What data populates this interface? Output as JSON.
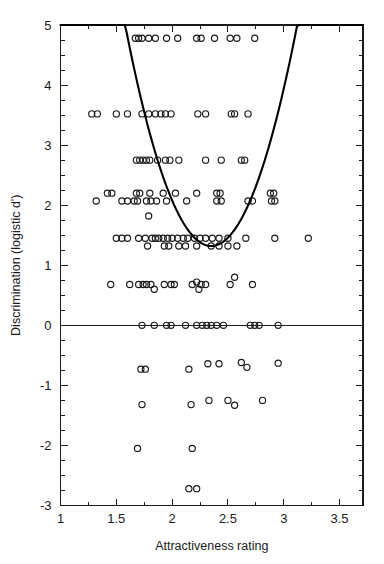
{
  "chart_data": {
    "type": "scatter",
    "title": "",
    "xlabel": "Attractiveness rating",
    "ylabel": "Discrimination (logistic d')",
    "xlim": [
      1,
      3.71
    ],
    "ylim": [
      -3,
      5
    ],
    "grid": false,
    "legend": null,
    "x_ticks": [
      1,
      1.5,
      2,
      2.5,
      3,
      3.5
    ],
    "x_ticklabels": [
      "1",
      "1.5",
      "2",
      "2.5",
      "3",
      "3.5"
    ],
    "x_minor_tick_step": 0.25,
    "y_ticks": [
      -3,
      -2,
      -1,
      0,
      1,
      2,
      3,
      4,
      5
    ],
    "y_ticklabels": [
      "-3",
      "-2",
      "-1",
      "0",
      "1",
      "2",
      "3",
      "4",
      "5"
    ],
    "y_minor_tick_step": 0.25,
    "marker": "open-circle",
    "marker_radius": 3.1,
    "reference_lines": [
      {
        "name": "zero-line",
        "orientation": "horizontal",
        "y": 0
      }
    ],
    "fit_curve": {
      "name": "quadratic-fit",
      "description": "U-shaped fitted curve",
      "vertex_x": 2.35,
      "vertex_y": 1.32,
      "curvature": 6.2,
      "x_start": 1.0,
      "x_end": 3.71,
      "y_at_x_start": 4.5,
      "y_at_x_end": 3.65
    },
    "points": [
      [
        1.67,
        4.78
      ],
      [
        1.7,
        4.78
      ],
      [
        1.73,
        4.78
      ],
      [
        1.79,
        4.78
      ],
      [
        1.85,
        4.78
      ],
      [
        1.95,
        4.78
      ],
      [
        2.05,
        4.78
      ],
      [
        2.22,
        4.78
      ],
      [
        2.26,
        4.78
      ],
      [
        2.38,
        4.78
      ],
      [
        2.52,
        4.78
      ],
      [
        2.58,
        4.78
      ],
      [
        2.74,
        4.78
      ],
      [
        1.28,
        3.52
      ],
      [
        1.33,
        3.52
      ],
      [
        1.5,
        3.52
      ],
      [
        1.6,
        3.52
      ],
      [
        1.73,
        3.52
      ],
      [
        1.79,
        3.52
      ],
      [
        1.85,
        3.52
      ],
      [
        1.9,
        3.52
      ],
      [
        1.94,
        3.52
      ],
      [
        1.99,
        3.52
      ],
      [
        2.23,
        3.52
      ],
      [
        2.3,
        3.52
      ],
      [
        2.53,
        3.52
      ],
      [
        2.56,
        3.52
      ],
      [
        2.68,
        3.52
      ],
      [
        1.68,
        2.75
      ],
      [
        1.71,
        2.75
      ],
      [
        1.74,
        2.75
      ],
      [
        1.77,
        2.75
      ],
      [
        1.8,
        2.75
      ],
      [
        1.87,
        2.75
      ],
      [
        1.94,
        2.75
      ],
      [
        1.98,
        2.75
      ],
      [
        2.06,
        2.75
      ],
      [
        2.3,
        2.75
      ],
      [
        2.44,
        2.75
      ],
      [
        2.62,
        2.75
      ],
      [
        2.65,
        2.75
      ],
      [
        1.42,
        2.2
      ],
      [
        1.46,
        2.2
      ],
      [
        1.68,
        2.2
      ],
      [
        1.71,
        2.2
      ],
      [
        1.8,
        2.2
      ],
      [
        1.92,
        2.2
      ],
      [
        2.03,
        2.2
      ],
      [
        2.22,
        2.2
      ],
      [
        2.4,
        2.2
      ],
      [
        2.43,
        2.2
      ],
      [
        2.88,
        2.2
      ],
      [
        2.91,
        2.2
      ],
      [
        1.32,
        2.07
      ],
      [
        1.55,
        2.07
      ],
      [
        1.6,
        2.07
      ],
      [
        1.66,
        2.07
      ],
      [
        1.69,
        2.07
      ],
      [
        1.77,
        2.07
      ],
      [
        1.81,
        2.07
      ],
      [
        1.86,
        2.07
      ],
      [
        1.95,
        2.07
      ],
      [
        2.13,
        2.07
      ],
      [
        2.4,
        2.07
      ],
      [
        2.44,
        2.07
      ],
      [
        2.68,
        2.07
      ],
      [
        2.72,
        2.07
      ],
      [
        2.89,
        2.07
      ],
      [
        2.92,
        2.07
      ],
      [
        1.5,
        1.45
      ],
      [
        1.55,
        1.45
      ],
      [
        1.6,
        1.45
      ],
      [
        1.7,
        1.45
      ],
      [
        1.76,
        1.45
      ],
      [
        1.79,
        1.82
      ],
      [
        1.82,
        1.45
      ],
      [
        1.85,
        1.45
      ],
      [
        1.88,
        1.45
      ],
      [
        1.92,
        1.45
      ],
      [
        1.96,
        1.45
      ],
      [
        2.0,
        1.45
      ],
      [
        2.05,
        1.45
      ],
      [
        2.1,
        1.45
      ],
      [
        2.14,
        1.45
      ],
      [
        2.2,
        1.45
      ],
      [
        2.25,
        1.45
      ],
      [
        2.3,
        1.45
      ],
      [
        2.36,
        1.45
      ],
      [
        2.42,
        1.45
      ],
      [
        2.5,
        1.45
      ],
      [
        2.66,
        1.45
      ],
      [
        2.92,
        1.45
      ],
      [
        3.22,
        1.45
      ],
      [
        1.78,
        1.32
      ],
      [
        1.93,
        1.32
      ],
      [
        1.97,
        1.32
      ],
      [
        2.06,
        1.32
      ],
      [
        2.12,
        1.32
      ],
      [
        2.22,
        1.32
      ],
      [
        2.35,
        1.32
      ],
      [
        2.42,
        1.32
      ],
      [
        2.5,
        1.32
      ],
      [
        2.58,
        1.32
      ],
      [
        1.45,
        0.68
      ],
      [
        1.62,
        0.68
      ],
      [
        1.7,
        0.68
      ],
      [
        1.74,
        0.68
      ],
      [
        1.77,
        0.68
      ],
      [
        1.81,
        0.68
      ],
      [
        1.93,
        0.68
      ],
      [
        1.99,
        0.68
      ],
      [
        2.02,
        0.68
      ],
      [
        2.18,
        0.68
      ],
      [
        2.22,
        0.72
      ],
      [
        2.26,
        0.68
      ],
      [
        2.3,
        0.68
      ],
      [
        2.52,
        0.68
      ],
      [
        2.56,
        0.8
      ],
      [
        2.72,
        0.68
      ],
      [
        1.84,
        0.6
      ],
      [
        2.24,
        0.6
      ],
      [
        1.73,
        0.0
      ],
      [
        1.84,
        0.0
      ],
      [
        1.95,
        0.0
      ],
      [
        1.99,
        0.0
      ],
      [
        2.12,
        0.0
      ],
      [
        2.22,
        0.0
      ],
      [
        2.27,
        0.0
      ],
      [
        2.31,
        0.0
      ],
      [
        2.35,
        0.0
      ],
      [
        2.4,
        0.0
      ],
      [
        2.46,
        0.0
      ],
      [
        2.7,
        0.0
      ],
      [
        2.74,
        0.0
      ],
      [
        2.78,
        0.0
      ],
      [
        2.95,
        0.0
      ],
      [
        1.72,
        -0.73
      ],
      [
        1.76,
        -0.73
      ],
      [
        2.15,
        -0.73
      ],
      [
        2.32,
        -0.64
      ],
      [
        2.42,
        -0.64
      ],
      [
        2.62,
        -0.62
      ],
      [
        2.67,
        -0.7
      ],
      [
        2.95,
        -0.63
      ],
      [
        1.69,
        -2.05
      ],
      [
        2.18,
        -2.05
      ],
      [
        1.73,
        -1.32
      ],
      [
        2.17,
        -1.32
      ],
      [
        2.33,
        -1.25
      ],
      [
        2.5,
        -1.25
      ],
      [
        2.56,
        -1.33
      ],
      [
        2.81,
        -1.25
      ],
      [
        2.15,
        -2.72
      ],
      [
        2.22,
        -2.72
      ]
    ]
  },
  "axis": {
    "x_title": "Attractiveness rating",
    "y_title": "Discrimination (logistic d')"
  }
}
